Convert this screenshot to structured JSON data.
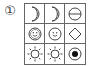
{
  "puzzle": {
    "number_label": "①",
    "grid": [
      [
        "moon",
        "moon",
        "circle-minus"
      ],
      [
        "smiley",
        "smiley",
        "diamond"
      ],
      [
        "sun",
        "sun",
        "circle-dot"
      ]
    ]
  }
}
